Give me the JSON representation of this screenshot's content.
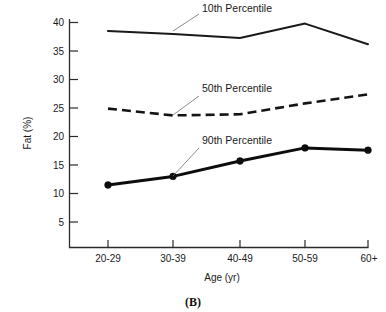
{
  "figure": {
    "panel_caption": "(B)",
    "axis_titles": {
      "x": "Age (yr)",
      "y": "Fat (%)"
    }
  },
  "chart_data": {
    "type": "line",
    "title": "",
    "subtitle": "",
    "xlabel": "Age (yr)",
    "ylabel": "Fat (%)",
    "categories": [
      "20-29",
      "30-39",
      "40-49",
      "50-59",
      "60+"
    ],
    "yticks": [
      5,
      10,
      15,
      20,
      25,
      30,
      35,
      40
    ],
    "ylim": [
      0,
      41
    ],
    "grid": false,
    "legend_position": "inline-annotations",
    "series": [
      {
        "name": "10th Percentile",
        "style": "solid-thin",
        "markers": false,
        "values": [
          38.5,
          38.0,
          37.3,
          39.8,
          36.2
        ]
      },
      {
        "name": "50th Percentile",
        "style": "dashed",
        "markers": false,
        "values": [
          24.9,
          23.7,
          23.9,
          25.8,
          27.4
        ]
      },
      {
        "name": "90th Percentile",
        "style": "solid-thick",
        "markers": true,
        "values": [
          11.5,
          13.0,
          15.7,
          18.0,
          17.6
        ]
      }
    ],
    "annotations": [
      {
        "text": "10th Percentile",
        "target_series": "10th Percentile",
        "target_category": "30-39"
      },
      {
        "text": "50th Percentile",
        "target_series": "50th Percentile",
        "target_category": "30-39"
      },
      {
        "text": "90th Percentile",
        "target_series": "90th Percentile",
        "target_category": "30-39"
      }
    ]
  },
  "ticklabels": {
    "y": [
      "40",
      "35",
      "30",
      "25",
      "20",
      "15",
      "10",
      "5"
    ],
    "x": [
      "20-29",
      "30-39",
      "40-49",
      "50-59",
      "60+"
    ]
  },
  "annotation_text": {
    "p10": "10th Percentile",
    "p50": "50th Percentile",
    "p90": "90th Percentile"
  }
}
